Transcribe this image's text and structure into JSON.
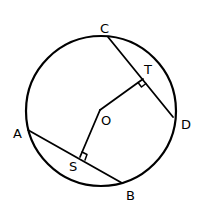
{
  "diagram": {
    "circle": {
      "center_label": "O",
      "cx": 101,
      "cy": 111,
      "r": 75
    },
    "points": {
      "A": {
        "label": "A",
        "x": 28,
        "y": 130
      },
      "B": {
        "label": "B",
        "x": 122,
        "y": 183
      },
      "C": {
        "label": "C",
        "x": 108,
        "y": 37
      },
      "D": {
        "label": "D",
        "x": 173,
        "y": 117
      },
      "O": {
        "label": "O",
        "x": 100,
        "y": 110
      },
      "S": {
        "label": "S",
        "x": 80,
        "y": 157
      },
      "T": {
        "label": "T",
        "x": 143,
        "y": 79
      }
    },
    "segments": [
      {
        "name": "chord-AB",
        "from": "A",
        "to": "B"
      },
      {
        "name": "chord-CD",
        "from": "C",
        "to": "D"
      },
      {
        "name": "radius-segment-OS",
        "from": "O",
        "to": "S"
      },
      {
        "name": "radius-segment-OT",
        "from": "O",
        "to": "T"
      }
    ],
    "right_angle_marks": [
      "S",
      "T"
    ],
    "stroke_color": "#000000",
    "background": "#ffffff"
  }
}
